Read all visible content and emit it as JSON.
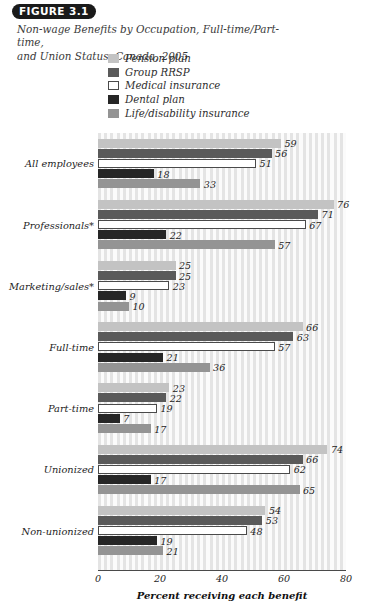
{
  "figure": {
    "label": "FIGURE 3.1",
    "title_line1": "Non-wage Benefits by Occupation, Full-time/Part-time,",
    "title_line2": "and Union Status, Canada, 2005"
  },
  "legend": {
    "position": "top-left",
    "items": [
      {
        "label": "Pension plan",
        "color": "#c3c3c3"
      },
      {
        "label": "Group RRSP",
        "color": "#5a5a5a"
      },
      {
        "label": "Medical insurance",
        "color": "#ffffff"
      },
      {
        "label": "Dental plan",
        "color": "#262626"
      },
      {
        "label": "Life/disability insurance",
        "color": "#949494"
      }
    ]
  },
  "chart_data": {
    "type": "bar",
    "orientation": "horizontal",
    "xlabel": "Percent receiving each benefit",
    "ylabel": "",
    "xlim": [
      0,
      80
    ],
    "xticks": [
      0,
      20,
      40,
      60,
      80
    ],
    "grid": "vertical-stripes",
    "categories": [
      "All employees",
      "Professionals*",
      "Marketing/sales*",
      "Full-time",
      "Part-time",
      "Unionized",
      "Non-unionized"
    ],
    "series": [
      {
        "name": "Pension plan",
        "color": "#c3c3c3",
        "values": [
          59,
          76,
          25,
          66,
          23,
          74,
          54
        ]
      },
      {
        "name": "Group RRSP",
        "color": "#5a5a5a",
        "values": [
          56,
          71,
          25,
          63,
          22,
          66,
          53
        ]
      },
      {
        "name": "Medical insurance",
        "color": "#ffffff",
        "values": [
          51,
          67,
          23,
          57,
          19,
          62,
          48
        ]
      },
      {
        "name": "Dental plan",
        "color": "#262626",
        "values": [
          18,
          22,
          9,
          21,
          7,
          17,
          19
        ]
      },
      {
        "name": "Life/disability insurance",
        "color": "#949494",
        "values": [
          33,
          57,
          10,
          36,
          17,
          65,
          21
        ]
      }
    ]
  }
}
